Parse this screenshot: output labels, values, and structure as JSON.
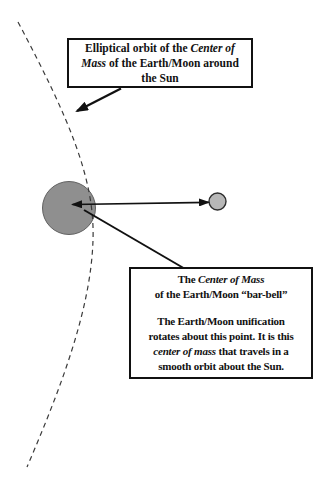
{
  "colors": {
    "background": "#ffffff",
    "earth_fill": "#8f8f8f",
    "earth_stroke": "#616161",
    "moon_fill": "#b7b7b7",
    "moon_stroke": "#2d2d2d",
    "orbit_dash": "#3a3a3a",
    "arrow": "#111111"
  },
  "orbit_label_box": {
    "line1_text": "Elliptical orbit of the ",
    "line1_italic": "Center of",
    "line2_italic": "Mass",
    "line2_text": " of the Earth/Moon around",
    "line3_text": "the Sun"
  },
  "center_of_mass_callout": {
    "line1_text": "The ",
    "line1_italic": "Center of Mass",
    "line2_text": "of the Earth/Moon “bar-bell”",
    "line3_text": "The Earth/Moon unification",
    "line4_text": "rotates about this point. It is this",
    "line5_italic": "center of mass",
    "line5_text": " that travels in a",
    "line6_text": "smooth orbit about the Sun."
  }
}
